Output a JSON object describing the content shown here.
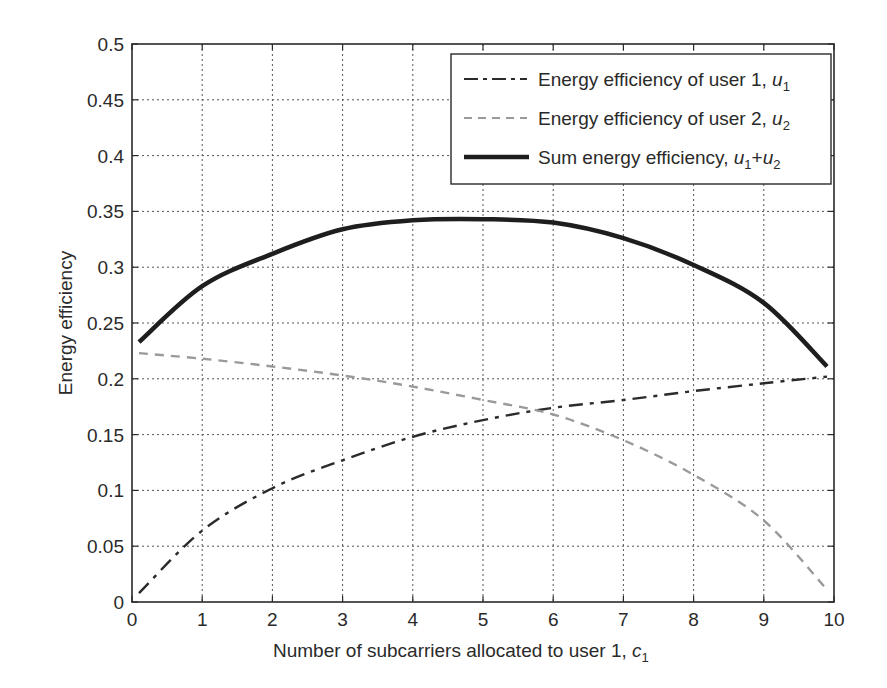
{
  "chart_data": {
    "type": "line",
    "title": "",
    "xlabel": "Number of subcarriers allocated to user 1, c1",
    "xlabel_main": "Number of subcarriers allocated to user 1, ",
    "xlabel_var": "c",
    "xlabel_sub": "1",
    "ylabel": "Energy efficiency",
    "xlim": [
      0,
      10
    ],
    "ylim": [
      0,
      0.5
    ],
    "xticks": [
      0,
      1,
      2,
      3,
      4,
      5,
      6,
      7,
      8,
      9,
      10
    ],
    "xtick_labels": [
      "0",
      "1",
      "2",
      "3",
      "4",
      "5",
      "6",
      "7",
      "8",
      "9",
      "10"
    ],
    "yticks": [
      0,
      0.05,
      0.1,
      0.15,
      0.2,
      0.25,
      0.3,
      0.35,
      0.4,
      0.45,
      0.5
    ],
    "ytick_labels": [
      "0",
      "0.05",
      "0.1",
      "0.15",
      "0.2",
      "0.25",
      "0.3",
      "0.35",
      "0.4",
      "0.45",
      "0.5"
    ],
    "grid": true,
    "legend_position": "upper right",
    "x": [
      0.1,
      1,
      2,
      3,
      4,
      5,
      6,
      7,
      8,
      9,
      9.9
    ],
    "series": [
      {
        "name": "Energy efficiency of user 1, u1",
        "label_main": "Energy efficiency of user 1, ",
        "label_var": "u",
        "label_sub": "1",
        "style": "dash-dot",
        "color": "#2b2b2b",
        "values": [
          0.008,
          0.064,
          0.102,
          0.127,
          0.148,
          0.163,
          0.174,
          0.181,
          0.189,
          0.196,
          0.202
        ]
      },
      {
        "name": "Energy efficiency of user 2, u2",
        "label_main": "Energy efficiency of user 2, ",
        "label_var": "u",
        "label_sub": "2",
        "style": "dashed",
        "color": "#9a9a9a",
        "values": [
          0.223,
          0.218,
          0.211,
          0.203,
          0.193,
          0.181,
          0.168,
          0.145,
          0.114,
          0.073,
          0.011
        ]
      },
      {
        "name": "Sum energy efficiency, u1+u2",
        "label_main": "Sum energy efficiency, ",
        "label_var": "u",
        "label_sub": "1",
        "label_plus": "+",
        "label_var2": "u",
        "label_sub2": "2",
        "style": "solid",
        "color": "#1e1e1e",
        "values": [
          0.233,
          0.283,
          0.312,
          0.334,
          0.342,
          0.343,
          0.34,
          0.326,
          0.302,
          0.268,
          0.211
        ]
      }
    ]
  }
}
